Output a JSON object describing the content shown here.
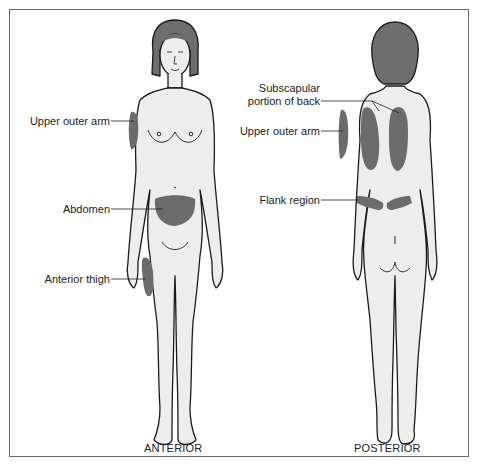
{
  "diagram": {
    "type": "anatomical-injection-sites",
    "colors": {
      "skin": "#ededed",
      "outline": "#1a1a1a",
      "site": "#6b6b6b",
      "hair": "#6e6e6e",
      "frame": "#6a6a6a"
    },
    "anterior": {
      "caption": "ANTERIOR",
      "labels": {
        "upper_outer_arm": "Upper outer arm",
        "abdomen": "Abdomen",
        "anterior_thigh": "Anterior thigh"
      }
    },
    "posterior": {
      "caption": "POSTERIOR",
      "labels": {
        "subscapular_line1": "Subscapular",
        "subscapular_line2": "portion of back",
        "upper_outer_arm": "Upper outer arm",
        "flank_region": "Flank region"
      }
    }
  }
}
